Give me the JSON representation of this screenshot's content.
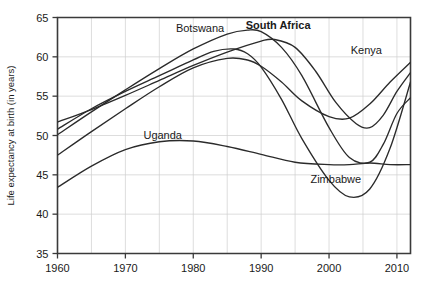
{
  "chart_data": {
    "type": "line",
    "title": "",
    "xlabel": "",
    "ylabel": "Life expectancy at birth (in years)",
    "xlim": [
      1960,
      2012
    ],
    "ylim": [
      35,
      65
    ],
    "xticks": [
      1960,
      1970,
      1980,
      1990,
      2000,
      2010
    ],
    "yticks": [
      35,
      40,
      45,
      50,
      55,
      60,
      65
    ],
    "grid": true,
    "legend": "inline-annotations",
    "series": [
      {
        "name": "Botswana",
        "label_x": 1981,
        "label_y": 63.2,
        "bold": false,
        "x": [
          1960,
          1965,
          1970,
          1975,
          1980,
          1985,
          1988,
          1990,
          1993,
          1996,
          2000,
          2003,
          2006,
          2008,
          2010,
          2012
        ],
        "values": [
          50.1,
          53.0,
          55.8,
          58.5,
          61.0,
          62.9,
          63.4,
          63.2,
          61.2,
          57.6,
          51.0,
          47.2,
          46.6,
          48.9,
          52.8,
          54.8
        ]
      },
      {
        "name": "South Africa",
        "label_x": 1992.5,
        "label_y": 63.6,
        "bold": true,
        "x": [
          1960,
          1965,
          1970,
          1975,
          1980,
          1985,
          1990,
          1992,
          1995,
          1998,
          2001,
          2004,
          2006,
          2008,
          2010,
          2012
        ],
        "values": [
          51.7,
          53.3,
          55.1,
          57.0,
          58.9,
          60.6,
          62.0,
          62.2,
          61.2,
          58.2,
          54.2,
          51.5,
          51.0,
          52.6,
          55.6,
          58.0
        ]
      },
      {
        "name": "Kenya",
        "label_x": 2005.5,
        "label_y": 60.4,
        "bold": false,
        "x": [
          1960,
          1965,
          1970,
          1975,
          1980,
          1985,
          1988,
          1990,
          1993,
          1996,
          2000,
          2003,
          2006,
          2009,
          2012
        ],
        "values": [
          47.5,
          50.5,
          53.4,
          56.2,
          58.6,
          59.8,
          59.6,
          58.8,
          56.8,
          54.4,
          52.4,
          52.2,
          54.0,
          56.8,
          59.3
        ]
      },
      {
        "name": "Zimbabwe",
        "label_x": 2001,
        "label_y": 44.0,
        "bold": false,
        "x": [
          1960,
          1965,
          1970,
          1975,
          1980,
          1983,
          1986,
          1988,
          1990,
          1993,
          1996,
          2000,
          2003,
          2006,
          2009,
          2012
        ],
        "values": [
          50.8,
          53.4,
          55.6,
          57.6,
          59.6,
          60.7,
          61.0,
          60.4,
          58.7,
          54.6,
          49.6,
          44.3,
          42.2,
          43.2,
          48.4,
          56.8
        ]
      },
      {
        "name": "Uganda",
        "label_x": 1975.5,
        "label_y": 49.5,
        "bold": false,
        "x": [
          1960,
          1965,
          1970,
          1975,
          1980,
          1985,
          1990,
          1995,
          2000,
          2003,
          2006,
          2009,
          2012
        ],
        "values": [
          43.4,
          46.1,
          48.2,
          49.2,
          49.3,
          48.6,
          47.6,
          46.6,
          46.3,
          46.3,
          46.5,
          46.3,
          46.3
        ]
      }
    ]
  }
}
